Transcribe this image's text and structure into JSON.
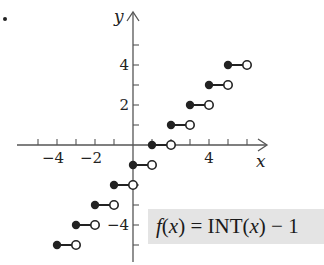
{
  "chart_data": {
    "type": "line",
    "subtype": "step-function",
    "title": "",
    "function_label": "f(x) = INT(x) − 1",
    "xlabel": "x",
    "ylabel": "y",
    "x_tick_labels": [
      "−4",
      "−2",
      "4"
    ],
    "y_tick_labels": [
      "4",
      "2",
      "−4"
    ],
    "xlim": [
      -5.5,
      6.3
    ],
    "ylim": [
      -6,
      6.7
    ],
    "grid": false,
    "legend": "none",
    "segments": [
      {
        "x_start": -4,
        "x_end": -3,
        "y": -5,
        "closed_left": true,
        "open_right": true
      },
      {
        "x_start": -3,
        "x_end": -2,
        "y": -4,
        "closed_left": true,
        "open_right": true
      },
      {
        "x_start": -2,
        "x_end": -1,
        "y": -3,
        "closed_left": true,
        "open_right": true
      },
      {
        "x_start": -1,
        "x_end": 0,
        "y": -2,
        "closed_left": true,
        "open_right": true
      },
      {
        "x_start": 0,
        "x_end": 1,
        "y": -1,
        "closed_left": true,
        "open_right": true
      },
      {
        "x_start": 1,
        "x_end": 2,
        "y": 0,
        "closed_left": true,
        "open_right": true
      },
      {
        "x_start": 2,
        "x_end": 3,
        "y": 1,
        "closed_left": true,
        "open_right": true
      },
      {
        "x_start": 3,
        "x_end": 4,
        "y": 2,
        "closed_left": true,
        "open_right": true
      },
      {
        "x_start": 4,
        "x_end": 5,
        "y": 3,
        "closed_left": true,
        "open_right": true
      },
      {
        "x_start": 5,
        "x_end": 6,
        "y": 4,
        "closed_left": true,
        "open_right": true
      }
    ]
  },
  "formula": {
    "f": "f",
    "open1": "(",
    "x1": "x",
    "close1": ") = INT(",
    "x2": "x",
    "close2": ") − 1"
  },
  "colors": {
    "ink": "#222222",
    "axis": "#555555",
    "label_box": "#e4e4e4"
  }
}
